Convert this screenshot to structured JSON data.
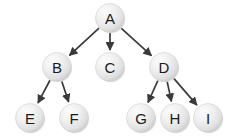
{
  "diagram": {
    "type": "tree",
    "background_color": "#ffffff",
    "node_fill_light": "#f4f4f4",
    "node_fill_dark": "#cfcfcf",
    "node_stroke_color": "#cfcfcf",
    "edge_color": "#3a3a3a",
    "label_color": "#1a1a1a",
    "node_radius": 14.5,
    "nodes": [
      {
        "id": "A",
        "label": "A",
        "cx": 110,
        "cy": 18,
        "level": 0
      },
      {
        "id": "B",
        "label": "B",
        "cx": 57,
        "cy": 67,
        "level": 1
      },
      {
        "id": "C",
        "label": "C",
        "cx": 110,
        "cy": 67,
        "level": 1
      },
      {
        "id": "D",
        "label": "D",
        "cx": 164,
        "cy": 67,
        "level": 1
      },
      {
        "id": "E",
        "label": "E",
        "cx": 30,
        "cy": 118,
        "level": 2
      },
      {
        "id": "F",
        "label": "F",
        "cx": 74,
        "cy": 118,
        "level": 2
      },
      {
        "id": "G",
        "label": "G",
        "cx": 141,
        "cy": 118,
        "level": 2
      },
      {
        "id": "H",
        "label": "H",
        "cx": 175,
        "cy": 118,
        "level": 2
      },
      {
        "id": "I",
        "label": "I",
        "cx": 208,
        "cy": 118,
        "level": 2
      }
    ],
    "edges": [
      {
        "from": "A",
        "to": "B",
        "directed": true
      },
      {
        "from": "A",
        "to": "C",
        "directed": true
      },
      {
        "from": "A",
        "to": "D",
        "directed": true
      },
      {
        "from": "B",
        "to": "E",
        "directed": true
      },
      {
        "from": "B",
        "to": "F",
        "directed": true
      },
      {
        "from": "D",
        "to": "G",
        "directed": true
      },
      {
        "from": "D",
        "to": "H",
        "directed": true
      },
      {
        "from": "D",
        "to": "I",
        "directed": true
      }
    ]
  }
}
